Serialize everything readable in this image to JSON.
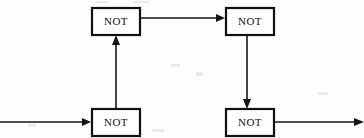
{
  "figure": {
    "title": "",
    "background_color": "#fdfdfd",
    "ink_color": "#151515",
    "box_fill": "#ffffff"
  },
  "diagram_data": {
    "type": "logic-gate-diagram",
    "description": "Chain of four NOT gates with external input on the left and external output on the right",
    "nodes": [
      {
        "id": "not-top-left",
        "label": "NOT",
        "x": 92,
        "y": 8,
        "width": 48,
        "height": 27
      },
      {
        "id": "not-top-right",
        "label": "NOT",
        "x": 226,
        "y": 8,
        "width": 48,
        "height": 27
      },
      {
        "id": "not-bottom-left",
        "label": "NOT",
        "x": 92,
        "y": 109,
        "width": 48,
        "height": 27
      },
      {
        "id": "not-bottom-right",
        "label": "NOT",
        "x": 226,
        "y": 109,
        "width": 48,
        "height": 27
      }
    ],
    "edges": [
      {
        "id": "edge-input",
        "from": "external-input",
        "to": "not-bottom-left",
        "direction": "right"
      },
      {
        "id": "edge-up",
        "from": "not-bottom-left",
        "to": "not-top-left",
        "direction": "up"
      },
      {
        "id": "edge-top",
        "from": "not-top-left",
        "to": "not-top-right",
        "direction": "right"
      },
      {
        "id": "edge-down",
        "from": "not-top-right",
        "to": "not-bottom-right",
        "direction": "down"
      },
      {
        "id": "edge-output",
        "from": "not-bottom-right",
        "to": "external-output",
        "direction": "right"
      }
    ]
  },
  "labels": {
    "gate": "NOT"
  }
}
